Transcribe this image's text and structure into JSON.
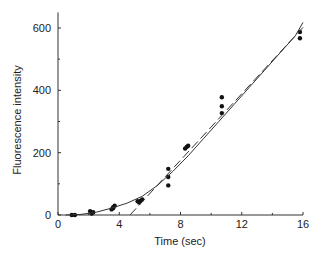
{
  "chart_data": {
    "type": "scatter",
    "title": "",
    "xlabel": "Time (sec)",
    "ylabel": "Fluorescence intensity",
    "xlim": [
      0,
      16
    ],
    "ylim": [
      0,
      650
    ],
    "xticks": [
      0,
      4,
      8,
      12,
      16
    ],
    "yticks": [
      0,
      200,
      400,
      600
    ],
    "grid": false,
    "legend": null,
    "series": [
      {
        "name": "measurements",
        "kind": "points",
        "points": [
          [
            0.9,
            0
          ],
          [
            1.1,
            0
          ],
          [
            2.2,
            5
          ],
          [
            2.3,
            9
          ],
          [
            2.1,
            12
          ],
          [
            3.5,
            18
          ],
          [
            3.6,
            25
          ],
          [
            3.7,
            30
          ],
          [
            3.6,
            22
          ],
          [
            5.3,
            40
          ],
          [
            5.4,
            46
          ],
          [
            5.5,
            50
          ],
          [
            5.2,
            44
          ],
          [
            7.2,
            95
          ],
          [
            7.2,
            122
          ],
          [
            7.2,
            148
          ],
          [
            8.3,
            213
          ],
          [
            8.4,
            218
          ],
          [
            8.5,
            222
          ],
          [
            10.7,
            327
          ],
          [
            10.7,
            349
          ],
          [
            10.7,
            378
          ],
          [
            15.8,
            567
          ],
          [
            15.8,
            587
          ]
        ]
      },
      {
        "name": "fit-curve",
        "kind": "solid-line",
        "points": [
          [
            0.5,
            0
          ],
          [
            1.5,
            2
          ],
          [
            2.5,
            9
          ],
          [
            3.5,
            22
          ],
          [
            4.5,
            38
          ],
          [
            5.5,
            60
          ],
          [
            6.5,
            95
          ],
          [
            7.5,
            140
          ],
          [
            8.5,
            190
          ],
          [
            9.5,
            245
          ],
          [
            10.5,
            300
          ],
          [
            11.5,
            355
          ],
          [
            12.5,
            410
          ],
          [
            13.5,
            465
          ],
          [
            14.5,
            520
          ],
          [
            15.5,
            575
          ],
          [
            16,
            618
          ]
        ]
      },
      {
        "name": "linear-fit",
        "kind": "dashed-line",
        "points": [
          [
            4.7,
            0
          ],
          [
            16,
            602
          ]
        ]
      }
    ]
  }
}
